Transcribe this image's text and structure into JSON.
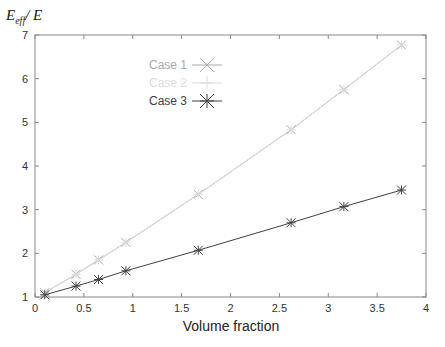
{
  "chart_data": {
    "type": "line",
    "title": "",
    "xlabel": "Volume fraction",
    "ylabel": "E_eff / E",
    "ylabel_main": "E",
    "ylabel_sub": "eff",
    "ylabel_tail": "/ E",
    "xlim": [
      0,
      4
    ],
    "ylim": [
      1,
      7
    ],
    "xticks": [
      "0",
      "0.5",
      "1",
      "1.5",
      "2",
      "2.5",
      "3",
      "3.5",
      "4"
    ],
    "yticks": [
      "1",
      "2",
      "3",
      "4",
      "5",
      "6",
      "7"
    ],
    "grid": false,
    "legend_position": "upper-left",
    "x": [
      0.1,
      0.42,
      0.65,
      0.93,
      1.67,
      2.62,
      3.16,
      3.75
    ],
    "series": [
      {
        "name": "Case 1",
        "color": "#a8a8a8",
        "marker": "x",
        "values": [
          1.1,
          1.52,
          1.85,
          2.25,
          3.35,
          4.83,
          5.75,
          6.77
        ]
      },
      {
        "name": "Case 2",
        "color": "#dcdcdc",
        "marker": "+",
        "values": [
          1.1,
          1.52,
          1.85,
          2.25,
          3.35,
          4.83,
          5.75,
          6.77
        ]
      },
      {
        "name": "Case 3",
        "color": "#404040",
        "marker": "*",
        "values": [
          1.05,
          1.25,
          1.4,
          1.6,
          2.07,
          2.7,
          3.07,
          3.45
        ]
      }
    ]
  }
}
